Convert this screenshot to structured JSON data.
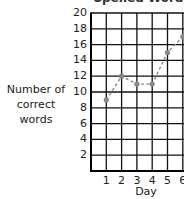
{
  "chart_data": {
    "type": "line",
    "title": "Spelled Words",
    "title_clipped": true,
    "xlabel": "Day",
    "ylabel": "Number of correct words",
    "ylabel_lines": [
      "Number of",
      "correct words"
    ],
    "x": [
      1,
      2,
      3,
      4,
      5,
      6
    ],
    "xticks": [
      "1",
      "2",
      "3",
      "4",
      "5",
      "6"
    ],
    "yticks": [
      "2",
      "4",
      "6",
      "8",
      "10",
      "12",
      "14",
      "16",
      "18",
      "20"
    ],
    "ylim": [
      0,
      20
    ],
    "xlim": [
      0,
      6
    ],
    "grid": true,
    "series": [
      {
        "name": "Correct words",
        "values": [
          9,
          12,
          11,
          11,
          15,
          17
        ],
        "style": "dashed",
        "color": "#888888"
      }
    ]
  }
}
